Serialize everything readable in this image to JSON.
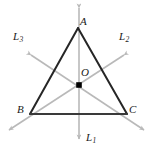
{
  "figure": {
    "colors": {
      "triangle_stroke": "#262626",
      "axis_stroke": "#b9b9b9",
      "center_dot": "#000000",
      "label_text": "#1a1a1a",
      "background": "#ffffff"
    },
    "vertices": [
      {
        "name": "A",
        "label": "A",
        "x": 78,
        "y": 28
      },
      {
        "name": "B",
        "label": "B",
        "x": 30,
        "y": 114
      },
      {
        "name": "C",
        "label": "C",
        "x": 127,
        "y": 114
      }
    ],
    "center": {
      "name": "O",
      "label": "O",
      "x": 79,
      "y": 85
    },
    "axes": [
      {
        "name": "L1",
        "label": "L",
        "subscript": "1",
        "x1": 79,
        "y1": 3,
        "x2": 79,
        "y2": 144,
        "arrows": "both"
      },
      {
        "name": "L2",
        "label": "L",
        "subscript": "2",
        "x1": 128,
        "y1": 52,
        "x2": 5,
        "y2": 133,
        "arrows": "both"
      },
      {
        "name": "L3",
        "label": "L",
        "subscript": "3",
        "x1": 27,
        "y1": 52,
        "x2": 148,
        "y2": 133,
        "arrows": "both"
      }
    ],
    "edges": [
      {
        "name": "AB",
        "from": "A",
        "to": "B"
      },
      {
        "name": "BC",
        "from": "B",
        "to": "C"
      },
      {
        "name": "CA",
        "from": "C",
        "to": "A"
      }
    ]
  }
}
